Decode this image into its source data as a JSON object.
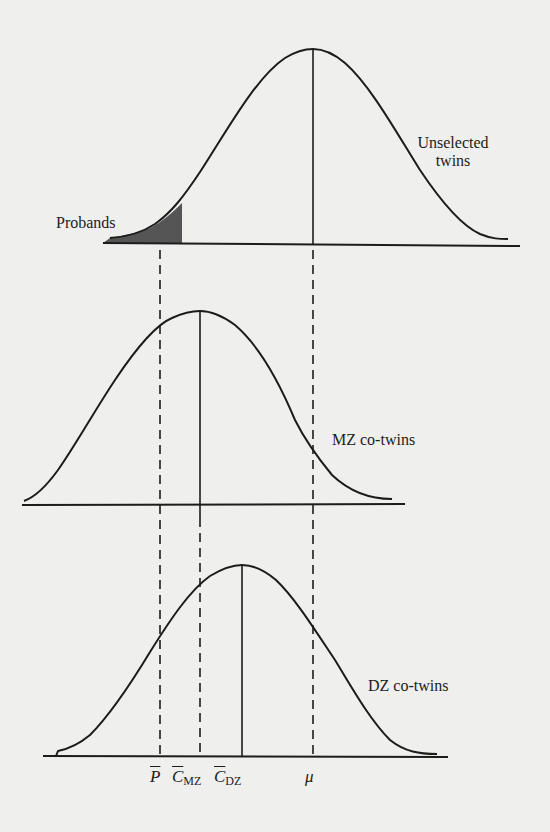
{
  "figure": {
    "background": "#efefed",
    "ink_color": "#1c1c1c",
    "shade_color": "#555555",
    "labels": {
      "unselected_line1": "Unselected",
      "unselected_line2": "twins",
      "probands": "Probands",
      "mz_cotwins": "MZ co-twins",
      "dz_cotwins": "DZ co-twins"
    },
    "axis_labels": {
      "p_bar": "P",
      "c_mz": "C",
      "c_mz_sub": "MZ",
      "c_dz": "C",
      "c_dz_sub": "DZ",
      "mu": "μ"
    },
    "distributions": [
      {
        "name": "Unselected twins",
        "mean_marker": "μ",
        "peak_x": 313,
        "peak_y": 49,
        "baseline_y": 244
      },
      {
        "name": "MZ co-twins",
        "mean_marker": "C̄MZ",
        "peak_x": 200,
        "peak_y": 311,
        "baseline_y": 505
      },
      {
        "name": "DZ co-twins",
        "mean_marker": "C̄DZ",
        "peak_x": 242,
        "peak_y": 565,
        "baseline_y": 756
      }
    ],
    "marker_order": [
      "P̄",
      "C̄MZ",
      "C̄DZ",
      "μ"
    ]
  }
}
